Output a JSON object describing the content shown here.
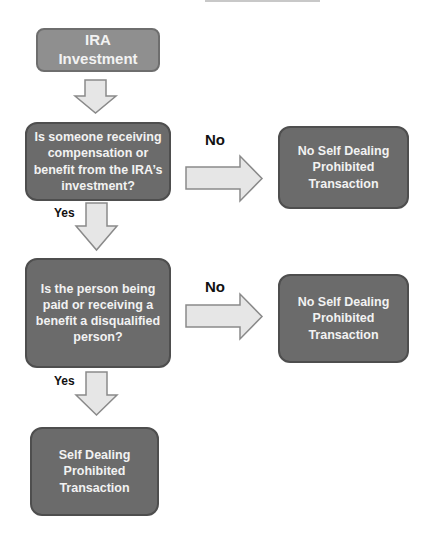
{
  "diagram": {
    "start": {
      "text": "IRA\nInvestment"
    },
    "decisions": [
      {
        "text": "Is someone receiving\ncompensation or\nbenefit from the IRA’s\ninvestment?"
      },
      {
        "text": "Is the person being\npaid or receiving a\nbenefit a disqualified\nperson?"
      }
    ],
    "outcomes": {
      "no_1": "No Self Dealing\nProhibited\nTransaction",
      "no_2": "No Self Dealing\nProhibited\nTransaction",
      "yes_final": "Self Dealing\nProhibited\nTransaction"
    },
    "branch_labels": {
      "no_1": "No",
      "no_2": "No",
      "yes_1": "Yes",
      "yes_2": "Yes"
    },
    "colors": {
      "start_fill": "#8f8f8f",
      "box_fill": "#6b6b6b",
      "arrow_fill": "#e6e6e6",
      "arrow_stroke": "#8a8a8a",
      "box_text": "#f2f2f2",
      "label_text": "#111111"
    }
  }
}
